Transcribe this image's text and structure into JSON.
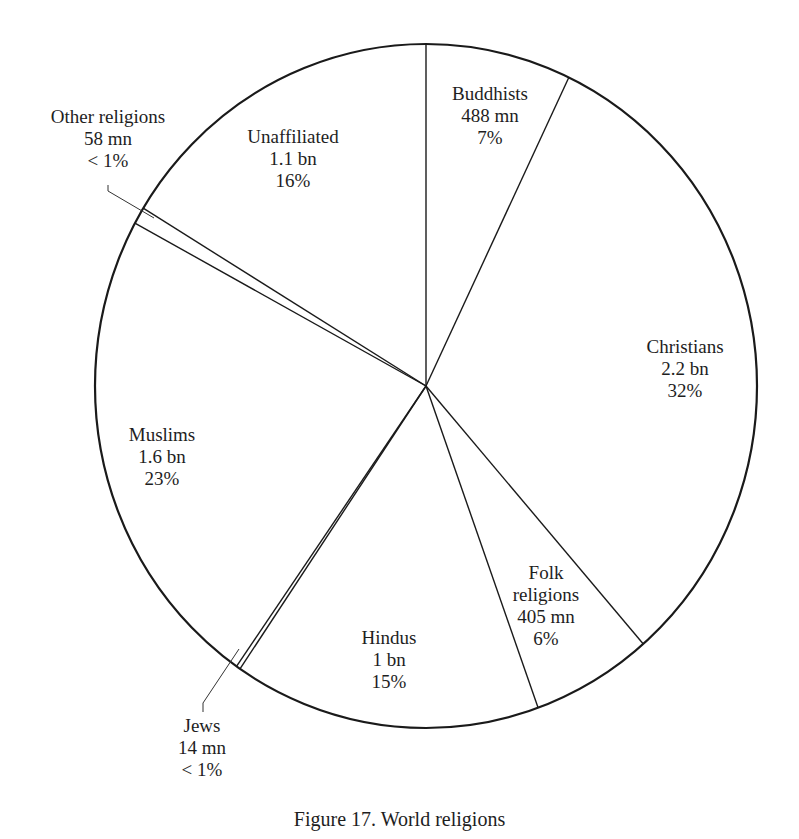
{
  "chart_data": {
    "type": "pie",
    "title": "Figure 17. World religions",
    "unit_note": "population; mn = million, bn = billion",
    "slices": [
      {
        "name": "Buddhists",
        "count": "488 mn",
        "percent": "7%",
        "value": 7.1
      },
      {
        "name": "Christians",
        "count": "2.2 bn",
        "percent": "32%",
        "value": 31.5
      },
      {
        "name": "Folk religions",
        "count": "405 mn",
        "percent": "6%",
        "value": 5.9
      },
      {
        "name": "Hindus",
        "count": "1 bn",
        "percent": "15%",
        "value": 15.0
      },
      {
        "name": "Jews",
        "count": "14 mn",
        "percent": "< 1%",
        "value": 0.2
      },
      {
        "name": "Muslims",
        "count": "1.6 bn",
        "percent": "23%",
        "value": 23.2
      },
      {
        "name": "Other religions",
        "count": "58 mn",
        "percent": "< 1%",
        "value": 0.8
      },
      {
        "name": "Unaffiliated",
        "count": "1.1 bn",
        "percent": "16%",
        "value": 16.3
      }
    ],
    "start_angle_deg": 0,
    "direction": "clockwise",
    "legend": "none (direct labels)"
  },
  "labels": {
    "buddhists": {
      "name": "Buddhists",
      "count": "488 mn",
      "percent": "7%"
    },
    "christians": {
      "name": "Christians",
      "count": "2.2 bn",
      "percent": "32%"
    },
    "folk": {
      "name1": "Folk",
      "name2": "religions",
      "count": "405 mn",
      "percent": "6%"
    },
    "hindus": {
      "name": "Hindus",
      "count": "1 bn",
      "percent": "15%"
    },
    "jews": {
      "name": "Jews",
      "count": "14 mn",
      "percent": "< 1%"
    },
    "muslims": {
      "name": "Muslims",
      "count": "1.6 bn",
      "percent": "23%"
    },
    "other": {
      "name": "Other religions",
      "count": "58 mn",
      "percent": "< 1%"
    },
    "unaffiliated": {
      "name": "Unaffiliated",
      "count": "1.1 bn",
      "percent": "16%"
    }
  },
  "caption": "Figure 17. World religions",
  "colors": {
    "line": "#1a1a1a",
    "background": "#ffffff"
  }
}
